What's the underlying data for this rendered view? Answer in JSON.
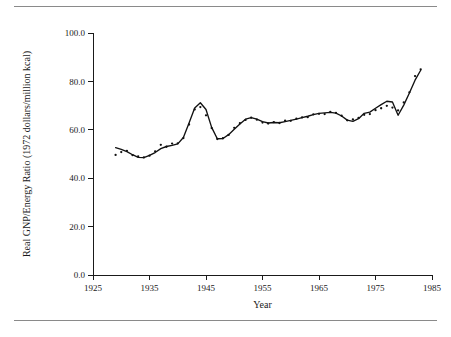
{
  "figure": {
    "clipped_top_caption": "",
    "year_axis_title": "Year",
    "value_axis_title": "Real GNP/Energy Ratio (1972 dollars/million kcal)"
  },
  "chart_data": {
    "type": "scatter",
    "title": "",
    "subtitle": "",
    "xlabel": "Year",
    "ylabel": "Real GNP/Energy Ratio (1972 dollars/million kcal)",
    "xlim": [
      1925,
      1985
    ],
    "ylim": [
      0.0,
      100.0
    ],
    "xticks": [
      1925,
      1935,
      1945,
      1955,
      1965,
      1975,
      1985
    ],
    "xtick_labels": [
      "1925",
      "1935",
      "1945",
      "1955",
      "1965",
      "1975",
      "1985"
    ],
    "yticks": [
      0.0,
      20.0,
      40.0,
      60.0,
      80.0,
      100.0
    ],
    "ytick_labels": [
      "0.0",
      "20.0",
      "40.0",
      "60.0",
      "80.0",
      "100.0"
    ],
    "grid": false,
    "legend": false,
    "legend_position": "none",
    "series": [
      {
        "name": "Observed annual ratio",
        "marker": "dot",
        "color": "#111111",
        "x": [
          1929,
          1930,
          1931,
          1932,
          1933,
          1934,
          1935,
          1936,
          1937,
          1938,
          1939,
          1940,
          1941,
          1942,
          1943,
          1944,
          1945,
          1946,
          1947,
          1948,
          1949,
          1950,
          1951,
          1952,
          1953,
          1954,
          1955,
          1956,
          1957,
          1958,
          1959,
          1960,
          1961,
          1962,
          1963,
          1964,
          1965,
          1966,
          1967,
          1968,
          1969,
          1970,
          1971,
          1972,
          1973,
          1974,
          1975,
          1976,
          1977,
          1978,
          1979,
          1980,
          1981,
          1982,
          1983
        ],
        "y": [
          49.6,
          50.8,
          51.3,
          49.5,
          49.0,
          48.6,
          49.3,
          51.1,
          53.8,
          53.0,
          54.3,
          54.4,
          56.6,
          62.2,
          68.4,
          69.4,
          66.0,
          60.7,
          56.2,
          56.5,
          57.9,
          60.8,
          62.7,
          64.1,
          65.0,
          64.2,
          63.0,
          62.6,
          63.2,
          62.8,
          63.8,
          63.7,
          64.6,
          65.1,
          65.2,
          66.4,
          66.6,
          66.5,
          67.4,
          67.0,
          65.8,
          63.9,
          64.3,
          64.9,
          66.2,
          66.5,
          68.1,
          68.9,
          69.9,
          69.2,
          68.0,
          71.3,
          75.5,
          82.2,
          85.0
        ]
      },
      {
        "name": "Smoothed trend",
        "marker": "line",
        "color": "#111111",
        "x": [
          1929,
          1930,
          1931,
          1932,
          1933,
          1934,
          1935,
          1936,
          1937,
          1938,
          1939,
          1940,
          1941,
          1942,
          1943,
          1944,
          1945,
          1946,
          1947,
          1948,
          1949,
          1950,
          1951,
          1952,
          1953,
          1954,
          1955,
          1956,
          1957,
          1958,
          1959,
          1960,
          1961,
          1962,
          1963,
          1964,
          1965,
          1966,
          1967,
          1968,
          1969,
          1970,
          1971,
          1972,
          1973,
          1974,
          1975,
          1976,
          1977,
          1978,
          1979,
          1980,
          1981,
          1982,
          1983
        ],
        "y": [
          52.6,
          51.9,
          51.0,
          49.7,
          48.6,
          48.5,
          49.4,
          50.6,
          52.2,
          53.1,
          53.6,
          54.2,
          56.8,
          62.8,
          69.0,
          71.2,
          68.4,
          61.0,
          56.3,
          56.4,
          58.0,
          60.2,
          62.4,
          64.4,
          65.0,
          64.4,
          63.4,
          62.8,
          63.0,
          62.9,
          63.4,
          63.9,
          64.4,
          65.0,
          65.6,
          66.3,
          66.8,
          67.0,
          67.2,
          66.9,
          65.7,
          64.0,
          63.5,
          64.6,
          66.8,
          67.3,
          68.9,
          70.4,
          71.8,
          71.5,
          66.0,
          70.2,
          75.2,
          80.5,
          84.6
        ]
      }
    ]
  }
}
